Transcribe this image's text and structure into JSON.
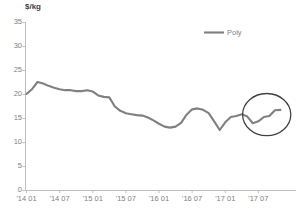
{
  "chart_data": {
    "type": "line",
    "title": "",
    "ylabel": "$/kg",
    "xlabel": "",
    "ylim": [
      0,
      35
    ],
    "yticks": [
      0,
      5,
      10,
      15,
      20,
      25,
      30,
      35
    ],
    "ytick_labels": [
      "0",
      "5",
      "10",
      "15",
      "20",
      "25",
      "30",
      "35"
    ],
    "xtick_labels": [
      "'14 01",
      "'14 07",
      "'15 01",
      "'15 07",
      "'16 01",
      "'16 07",
      "'17 01",
      "'17 07"
    ],
    "grid": false,
    "legend_position": "top-right",
    "legend": [
      "Poly"
    ],
    "series": [
      {
        "name": "Poly",
        "color": "#808080",
        "x": [
          "'14 01",
          "'14 02",
          "'14 03",
          "'14 04",
          "'14 05",
          "'14 06",
          "'14 07",
          "'14 08",
          "'14 09",
          "'14 10",
          "'14 11",
          "'14 12",
          "'15 01",
          "'15 02",
          "'15 03",
          "'15 04",
          "'15 05",
          "'15 06",
          "'15 07",
          "'15 08",
          "'15 09",
          "'15 10",
          "'15 11",
          "'15 12",
          "'16 01",
          "'16 02",
          "'16 03",
          "'16 04",
          "'16 05",
          "'16 06",
          "'16 07",
          "'16 08",
          "'16 09",
          "'16 10",
          "'16 11",
          "'16 12",
          "'17 01",
          "'17 02",
          "'17 03",
          "'17 04",
          "'17 05",
          "'17 06",
          "'17 07",
          "'17 08",
          "'17 09",
          "'17 10",
          "'17 11"
        ],
        "values": [
          20.0,
          21.0,
          22.5,
          22.2,
          21.7,
          21.3,
          21.0,
          20.8,
          20.8,
          20.6,
          20.6,
          20.8,
          20.5,
          19.7,
          19.4,
          19.3,
          17.4,
          16.5,
          16.0,
          15.8,
          15.6,
          15.5,
          15.1,
          14.5,
          13.8,
          13.2,
          13.0,
          13.2,
          14.0,
          15.7,
          16.8,
          17.0,
          16.7,
          16.0,
          14.3,
          12.5,
          14.1,
          15.2,
          15.4,
          15.8,
          15.3,
          13.9,
          14.3,
          15.2,
          15.4,
          16.6,
          16.7
        ]
      }
    ],
    "annotations": [
      {
        "type": "ellipse",
        "name": "highlight-ellipse",
        "color": "#404040",
        "cx_pct": 88.6,
        "cy_pct": 53.3,
        "rx_pct": 8.0,
        "ry_pct": 9.8,
        "note": "Highlights the H2 2017 polysilicon price rebound"
      }
    ]
  }
}
